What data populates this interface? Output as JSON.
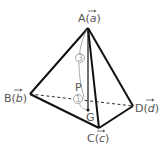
{
  "diagram": {
    "type": "tetrahedron",
    "vertices": {
      "A": {
        "label": "A",
        "vector": "a",
        "x": 88,
        "y": 28
      },
      "B": {
        "label": "B",
        "vector": "b",
        "x": 30,
        "y": 94
      },
      "C": {
        "label": "C",
        "vector": "c",
        "x": 99,
        "y": 128
      },
      "D": {
        "label": "D",
        "vector": "d",
        "x": 133,
        "y": 106
      }
    },
    "points": {
      "G": {
        "label": "G",
        "x": 88,
        "y": 110
      },
      "P": {
        "label": "P",
        "x": 84,
        "y": 99
      }
    },
    "ratio_labels": {
      "AP": "3",
      "PG": "1"
    },
    "colors": {
      "edge": "#111111",
      "hidden_edge": "#333333",
      "arc": "#aaaaaa",
      "label": "#555555"
    }
  }
}
